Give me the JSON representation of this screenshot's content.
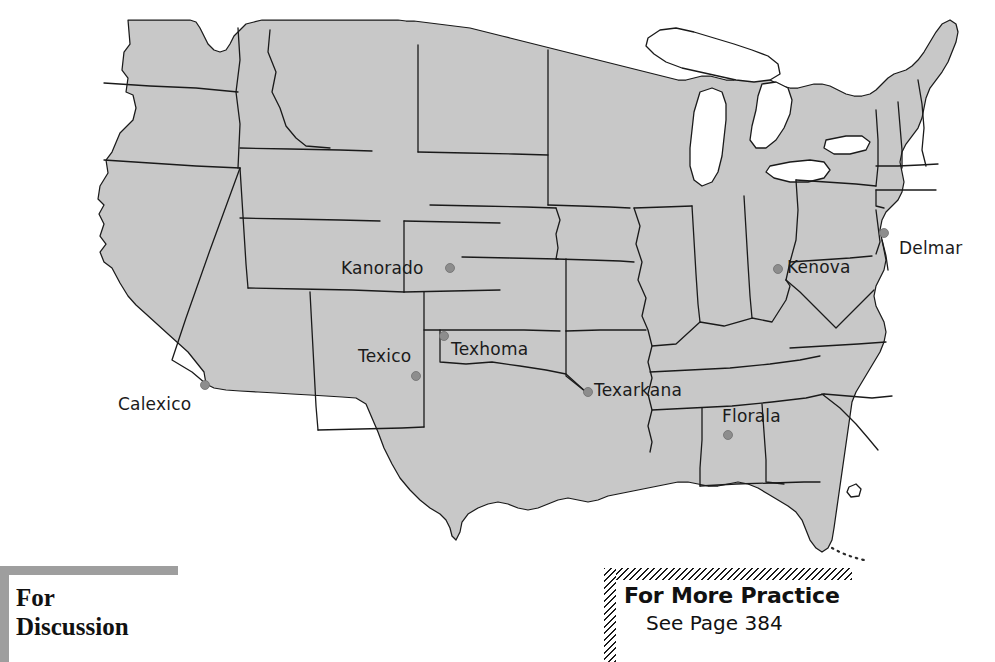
{
  "page": {
    "background_color": "#ffffff",
    "width": 995,
    "height": 662
  },
  "map": {
    "name": "united-states-border-cities-map",
    "land_fill_color": "#c8c8c8",
    "border_color": "#1a1a1a",
    "lake_fill_color": "#ffffff",
    "dot_color": "#8d8d8d",
    "cities": [
      {
        "name": "Calexico",
        "label": "Calexico",
        "dot_x": 205,
        "dot_y": 385,
        "label_x": 118,
        "label_y": 396,
        "anchor": "left"
      },
      {
        "name": "Texico",
        "label": "Texico",
        "dot_x": 416,
        "dot_y": 376,
        "label_x": 358,
        "label_y": 348,
        "anchor": "left"
      },
      {
        "name": "Kanorado",
        "label": "Kanorado",
        "dot_x": 450,
        "dot_y": 268,
        "label_x": 341,
        "label_y": 260,
        "anchor": "left"
      },
      {
        "name": "Texhoma",
        "label": "Texhoma",
        "dot_x": 444,
        "dot_y": 336,
        "label_x": 451,
        "label_y": 341,
        "anchor": "left"
      },
      {
        "name": "Texarkana",
        "label": "Texarkana",
        "dot_x": 588,
        "dot_y": 392,
        "label_x": 594,
        "label_y": 382,
        "anchor": "left"
      },
      {
        "name": "Florala",
        "label": "Florala",
        "dot_x": 728,
        "dot_y": 435,
        "label_x": 722,
        "label_y": 408,
        "anchor": "left"
      },
      {
        "name": "Kenova",
        "label": "Kenova",
        "dot_x": 778,
        "dot_y": 269,
        "label_x": 787,
        "label_y": 259,
        "anchor": "left"
      },
      {
        "name": "Delmar",
        "label": "Delmar",
        "dot_x": 884,
        "dot_y": 233,
        "label_x": 899,
        "label_y": 240,
        "anchor": "left"
      }
    ]
  },
  "for_discussion": {
    "line1": "For",
    "line2": "Discussion",
    "rule_color": "#9e9e9e"
  },
  "for_more_practice": {
    "title": "For More Practice",
    "subtitle": "See Page 384",
    "page_number": "384",
    "rule_style": "diagonal-hatch"
  }
}
